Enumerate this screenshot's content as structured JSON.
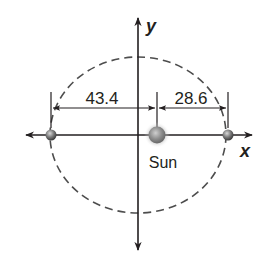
{
  "diagram": {
    "type": "elliptical orbit",
    "axes": {
      "x_label": "x",
      "y_label": "y"
    },
    "focus": {
      "label": "Sun"
    },
    "dimensions": {
      "left_distance": "43.4",
      "right_distance": "28.6"
    },
    "colors": {
      "line": "#231f20",
      "orbit_dash": "#4d4d4d",
      "planet": "#6b6b6b",
      "sun": "#8a8a8a"
    }
  }
}
